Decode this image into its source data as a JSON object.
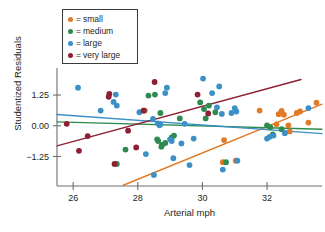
{
  "chart_data": {
    "type": "scatter",
    "title": "",
    "xlabel": "Arterial mph",
    "ylabel": "Studentized Residuals",
    "xlim": [
      25.5,
      33.7
    ],
    "ylim": [
      -2.45,
      2.35
    ],
    "xticks": [
      26,
      28,
      30,
      32
    ],
    "xtick_labels": [
      "26",
      "28",
      "30",
      "32"
    ],
    "yticks": [
      1.25,
      0.0,
      -1.25
    ],
    "ytick_labels": [
      "1.25",
      "0.00",
      "−1.25"
    ],
    "grid": false,
    "legend_position": "top-left",
    "legend_entries": [
      {
        "label": "small",
        "color": "#e07b2a",
        "prefix": "="
      },
      {
        "label": "medium",
        "color": "#2e8b4f",
        "prefix": "="
      },
      {
        "label": "large",
        "color": "#3b90c7",
        "prefix": "="
      },
      {
        "label": "very large",
        "color": "#8e2035",
        "prefix": "="
      }
    ],
    "series": [
      {
        "name": "small",
        "color": "#e07b2a",
        "points": [
          [
            30.63,
            -1.48
          ],
          [
            30.67,
            -0.58
          ],
          [
            31.77,
            0.62
          ],
          [
            32.29,
            0.06
          ],
          [
            32.36,
            0.47
          ],
          [
            32.45,
            0.6
          ],
          [
            32.52,
            0.45
          ],
          [
            32.66,
            0.02
          ],
          [
            32.7,
            -0.23
          ],
          [
            32.92,
            0.52
          ],
          [
            33.02,
            0.58
          ],
          [
            33.28,
            0.13
          ],
          [
            33.53,
            0.94
          ],
          [
            28.22,
            0.62
          ],
          [
            31.03,
            -1.42
          ]
        ]
      },
      {
        "name": "medium",
        "color": "#2e8b4f",
        "points": [
          [
            27.35,
            -1.55
          ],
          [
            28.33,
            1.23
          ],
          [
            28.53,
            1.27
          ],
          [
            28.6,
            -0.55
          ],
          [
            28.63,
            -0.62
          ],
          [
            28.7,
            0.52
          ],
          [
            28.73,
            -0.85
          ],
          [
            28.75,
            -0.78
          ],
          [
            28.85,
            -0.7
          ],
          [
            29.05,
            -0.47
          ],
          [
            29.12,
            -0.4
          ],
          [
            29.3,
            0.3
          ],
          [
            29.93,
            0.95
          ],
          [
            30.05,
            0.68
          ],
          [
            30.1,
            0.3
          ],
          [
            30.2,
            0.82
          ],
          [
            30.73,
            -1.48
          ],
          [
            27.62,
            -0.97
          ],
          [
            32.0,
            0.02
          ],
          [
            32.1,
            -0.06
          ],
          [
            32.18,
            -0.35
          ],
          [
            32.45,
            -0.14
          ],
          [
            30.4,
            0.55
          ]
        ]
      },
      {
        "name": "large",
        "color": "#3b90c7",
        "points": [
          [
            26.15,
            1.55
          ],
          [
            26.85,
            0.62
          ],
          [
            27.25,
            0.97
          ],
          [
            27.32,
            1.27
          ],
          [
            27.35,
            0.82
          ],
          [
            28.05,
            0.55
          ],
          [
            28.18,
            0.62
          ],
          [
            28.25,
            -1.15
          ],
          [
            28.47,
            0.28
          ],
          [
            28.5,
            -2.0
          ],
          [
            28.62,
            0.1
          ],
          [
            28.67,
            0.02
          ],
          [
            28.7,
            0.06
          ],
          [
            28.85,
            1.33
          ],
          [
            28.9,
            1.55
          ],
          [
            29.0,
            -0.55
          ],
          [
            29.05,
            -0.62
          ],
          [
            29.1,
            -1.32
          ],
          [
            29.35,
            -0.72
          ],
          [
            29.6,
            -1.6
          ],
          [
            29.73,
            -0.52
          ],
          [
            30.02,
            1.92
          ],
          [
            30.3,
            1.33
          ],
          [
            30.45,
            0.75
          ],
          [
            30.52,
            1.6
          ],
          [
            30.6,
            0.48
          ],
          [
            30.63,
            -1.78
          ],
          [
            30.9,
            0.52
          ],
          [
            31.0,
            0.72
          ],
          [
            31.05,
            0.58
          ],
          [
            31.08,
            -1.42
          ],
          [
            32.0,
            -0.52
          ],
          [
            32.08,
            -0.45
          ],
          [
            32.2,
            -0.4
          ],
          [
            32.55,
            -0.3
          ],
          [
            33.28,
            0.72
          ],
          [
            29.45,
            0.08
          ]
        ]
      },
      {
        "name": "very large",
        "color": "#8e2035",
        "points": [
          [
            25.8,
            0.08
          ],
          [
            26.18,
            -1.02
          ],
          [
            26.45,
            -0.42
          ],
          [
            27.1,
            1.18
          ],
          [
            27.12,
            1.3
          ],
          [
            27.28,
            -1.55
          ],
          [
            27.7,
            -0.2
          ],
          [
            27.95,
            -0.88
          ],
          [
            28.18,
            0.62
          ],
          [
            28.52,
            1.78
          ],
          [
            29.85,
            1.27
          ],
          [
            30.18,
            0.5
          ]
        ]
      }
    ],
    "trend_lines": [
      {
        "name": "small",
        "color": "#e07b2a",
        "x0": 27.55,
        "y0": -2.42,
        "x1": 33.7,
        "y1": 0.88
      },
      {
        "name": "medium",
        "color": "#2e8b4f",
        "x0": 25.5,
        "y0": 0.16,
        "x1": 33.7,
        "y1": -0.14
      },
      {
        "name": "large",
        "color": "#3b90c7",
        "x0": 25.5,
        "y0": 0.46,
        "x1": 33.7,
        "y1": -0.32
      },
      {
        "name": "very large",
        "color": "#8e2035",
        "x0": 25.5,
        "y0": -0.82,
        "x1": 33.05,
        "y1": 1.88
      }
    ]
  }
}
